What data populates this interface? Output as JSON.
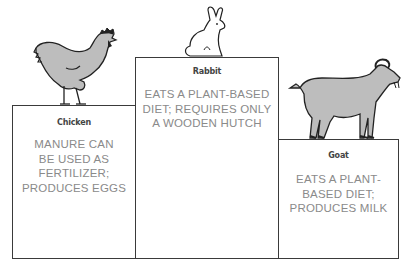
{
  "animals": [
    {
      "name": "Chicken",
      "icon": "chicken-icon",
      "desc_lines": [
        "MANURE CAN",
        "BE USED AS",
        "FERTILIZER;",
        "PRODUCES EGGS"
      ]
    },
    {
      "name": "Rabbit",
      "icon": "rabbit-icon",
      "desc_lines": [
        "EATS A PLANT-BASED",
        "DIET; REQUIRES ONLY",
        "A WOODEN HUTCH"
      ]
    },
    {
      "name": "Goat",
      "icon": "goat-icon",
      "desc_lines": [
        "EATS A PLANT-",
        "BASED DIET;",
        "PRODUCES MILK"
      ]
    }
  ],
  "colors": {
    "animal_fill": "#bdbdbd",
    "outline": "#222222",
    "box_border": "#3a3a3a",
    "desc_text": "#8a8a8a"
  }
}
